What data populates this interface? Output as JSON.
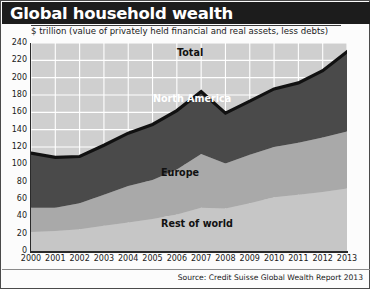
{
  "header": {
    "title": "Global household wealth",
    "subtitle": "$ trillion (value of privately held financial and real assets, less debts)"
  },
  "source": "Source: Credit Suisse Global Wealth Report 2013",
  "series_labels": {
    "total": "Total",
    "north_america": "North America",
    "europe": "Europe",
    "rest_of_world": "Rest of world"
  },
  "colors": {
    "plot_background": "#cfcfcf",
    "gridline": "#ffffff",
    "north_america": "#4a4a4a",
    "europe": "#a9a9a9",
    "rest_of_world": "#c6c6c6",
    "total_line": "#111111",
    "title_bar": "#1c1c1c",
    "title_text": "#ffffff"
  },
  "chart_data": {
    "type": "area",
    "title": "Global household wealth",
    "subtitle": "$ trillion (value of privately held financial and real assets, less debts)",
    "xlabel": "",
    "ylabel": "$ trillion",
    "ylim": [
      0,
      240
    ],
    "ytick_step": 20,
    "yticks": [
      0,
      20,
      40,
      60,
      80,
      100,
      120,
      140,
      160,
      180,
      200,
      220,
      240
    ],
    "xticks": [
      "2000",
      "2001",
      "2002",
      "2003",
      "2004",
      "2005",
      "2006",
      "2007",
      "2008",
      "2009",
      "2010",
      "2011",
      "2012",
      "2013"
    ],
    "categories": [
      2000,
      2001,
      2002,
      2003,
      2004,
      2005,
      2006,
      2007,
      2008,
      2009,
      2010,
      2011,
      2012,
      2013
    ],
    "grid": true,
    "legend": "inline-annotations",
    "stacked": true,
    "series": [
      {
        "name": "Rest of world",
        "values": [
          22,
          23,
          25,
          29,
          33,
          37,
          42,
          50,
          49,
          55,
          62,
          65,
          68,
          72
        ]
      },
      {
        "name": "Europe",
        "values": [
          28,
          27,
          30,
          36,
          42,
          45,
          52,
          62,
          52,
          56,
          58,
          60,
          63,
          66
        ]
      },
      {
        "name": "North America",
        "values": [
          63,
          58,
          54,
          57,
          61,
          64,
          68,
          72,
          58,
          62,
          67,
          69,
          77,
          92
        ]
      }
    ],
    "total": {
      "name": "Total",
      "values": [
        113,
        108,
        109,
        122,
        136,
        146,
        162,
        184,
        159,
        173,
        187,
        194,
        208,
        230
      ]
    },
    "annotations": [
      {
        "text": "Total",
        "series": "Total"
      },
      {
        "text": "North America",
        "series": "North America"
      },
      {
        "text": "Europe",
        "series": "Europe"
      },
      {
        "text": "Rest of world",
        "series": "Rest of world"
      }
    ]
  }
}
